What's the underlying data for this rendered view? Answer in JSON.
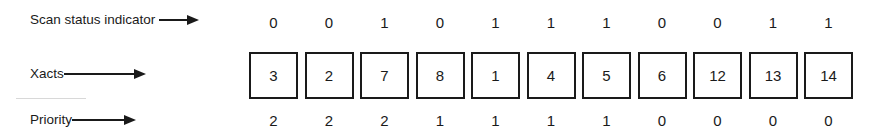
{
  "labels": {
    "scan_status": "Scan status indicator",
    "xacts": "Xacts",
    "priority": "Priority"
  },
  "columns": [
    {
      "scan": "0",
      "xact": "3",
      "priority": "2"
    },
    {
      "scan": "0",
      "xact": "2",
      "priority": "2"
    },
    {
      "scan": "1",
      "xact": "7",
      "priority": "2"
    },
    {
      "scan": "0",
      "xact": "8",
      "priority": "1"
    },
    {
      "scan": "1",
      "xact": "1",
      "priority": "1"
    },
    {
      "scan": "1",
      "xact": "4",
      "priority": "1"
    },
    {
      "scan": "1",
      "xact": "5",
      "priority": "1"
    },
    {
      "scan": "0",
      "xact": "6",
      "priority": "0"
    },
    {
      "scan": "0",
      "xact": "12",
      "priority": "0"
    },
    {
      "scan": "1",
      "xact": "13",
      "priority": "0"
    },
    {
      "scan": "1",
      "xact": "14",
      "priority": "0"
    }
  ],
  "icons": {
    "arrow": "right-arrow-icon"
  },
  "colors": {
    "ink": "#1a1a1a",
    "background": "#ffffff"
  }
}
